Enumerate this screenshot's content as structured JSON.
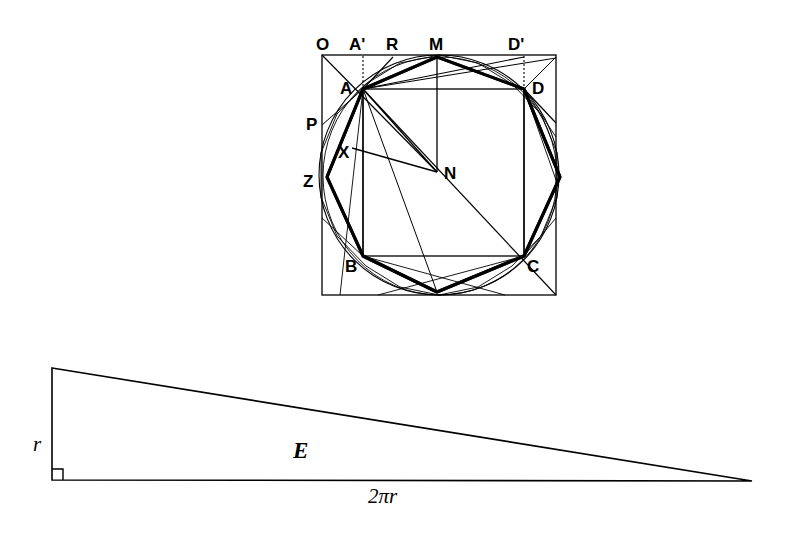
{
  "figure": {
    "background_color": "#ffffff",
    "ink_color": "#000000"
  },
  "top_figure": {
    "name": "circle-polygon-construction",
    "description": "Outer square with inscribed circle, inscribed square ABCD, bold octagon and auxiliary construction lines",
    "labels": [
      {
        "id": "O",
        "text": "O",
        "x": 316,
        "y": 36,
        "style": "sans-bold"
      },
      {
        "id": "Ap",
        "text": "A'",
        "x": 349,
        "y": 36,
        "style": "sans-bold"
      },
      {
        "id": "R",
        "text": "R",
        "x": 386,
        "y": 36,
        "style": "sans-bold"
      },
      {
        "id": "M",
        "text": "M",
        "x": 429,
        "y": 36,
        "style": "sans-bold"
      },
      {
        "id": "Dp",
        "text": "D'",
        "x": 508,
        "y": 36,
        "style": "sans-bold"
      },
      {
        "id": "A",
        "text": "A",
        "x": 340,
        "y": 80,
        "style": "sans-bold"
      },
      {
        "id": "D",
        "text": "D",
        "x": 532,
        "y": 80,
        "style": "sans-bold"
      },
      {
        "id": "P",
        "text": "P",
        "x": 306,
        "y": 116,
        "style": "sans-bold"
      },
      {
        "id": "X",
        "text": "X",
        "x": 338,
        "y": 144,
        "style": "sans-bold"
      },
      {
        "id": "Z",
        "text": "Z",
        "x": 303,
        "y": 173,
        "style": "sans-bold"
      },
      {
        "id": "N",
        "text": "N",
        "x": 444,
        "y": 165,
        "style": "sans-bold"
      },
      {
        "id": "B",
        "text": "B",
        "x": 345,
        "y": 258,
        "style": "sans-bold"
      },
      {
        "id": "C",
        "text": "C",
        "x": 527,
        "y": 258,
        "style": "sans-bold"
      }
    ],
    "geometry": {
      "outer_square": {
        "left": 322,
        "top": 55,
        "right": 556,
        "bottom": 295
      },
      "circle": {
        "cx": 439,
        "cy": 175,
        "r": 120
      },
      "inscribed_square_ABCD": {
        "A": [
          363,
          89
        ],
        "D": [
          524,
          89
        ],
        "C": [
          524,
          256
        ],
        "B": [
          363,
          256
        ]
      },
      "octagon_vertices": [
        [
          437,
          57
        ],
        [
          524,
          89
        ],
        [
          560,
          177
        ],
        [
          524,
          256
        ],
        [
          437,
          292
        ],
        [
          363,
          256
        ],
        [
          327,
          177
        ],
        [
          363,
          89
        ]
      ],
      "center_N": [
        437,
        172
      ],
      "point_M": [
        437,
        57
      ],
      "point_R": [
        393,
        57
      ],
      "point_A_prime": [
        363,
        57
      ],
      "point_D_prime": [
        524,
        57
      ],
      "point_P": [
        322,
        125
      ],
      "point_X": [
        352,
        158
      ],
      "point_Z": [
        327,
        177
      ]
    }
  },
  "bottom_figure": {
    "name": "area-triangle",
    "description": "Right triangle with vertical leg r, horizontal leg 2 pi r, and area label E",
    "labels": [
      {
        "id": "r",
        "text": "r",
        "x": 33,
        "y": 434,
        "style": "serif-italic"
      },
      {
        "id": "E",
        "text": "E",
        "x": 293,
        "y": 439,
        "style": "serif-bold-italic"
      },
      {
        "id": "2pir",
        "text": "2πr",
        "x": 368,
        "y": 486,
        "style": "serif-italic"
      }
    ],
    "geometry": {
      "apex_top": [
        52,
        368
      ],
      "right_angle_corner": [
        52,
        480
      ],
      "apex_right": [
        752,
        481
      ],
      "right_angle_marker_size": 11
    }
  }
}
